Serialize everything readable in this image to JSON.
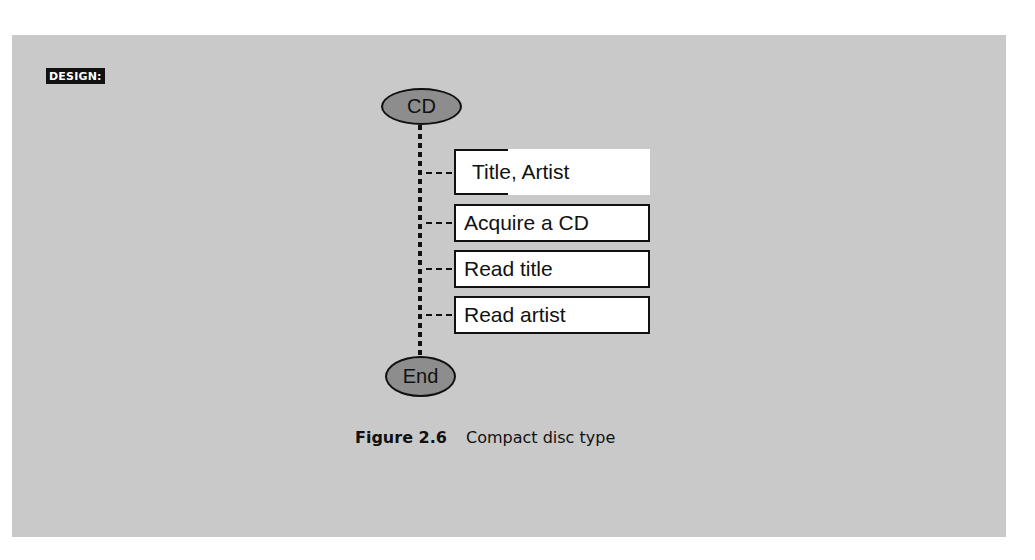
{
  "page": {
    "top_text_fragment": "type"
  },
  "section_tag": "DESIGN:",
  "diagram": {
    "start_node": "CD",
    "end_node": "End",
    "header_box": "Title, Artist",
    "steps": [
      {
        "label": "Acquire a CD"
      },
      {
        "label": "Read title"
      },
      {
        "label": "Read artist"
      }
    ]
  },
  "caption": {
    "figure_number": "Figure 2.6",
    "title": "Compact disc type"
  },
  "colors": {
    "panel_background": "#c9c9c9",
    "ellipse_fill": "#8d8d8d",
    "line": "#111111",
    "box_fill": "#ffffff"
  }
}
